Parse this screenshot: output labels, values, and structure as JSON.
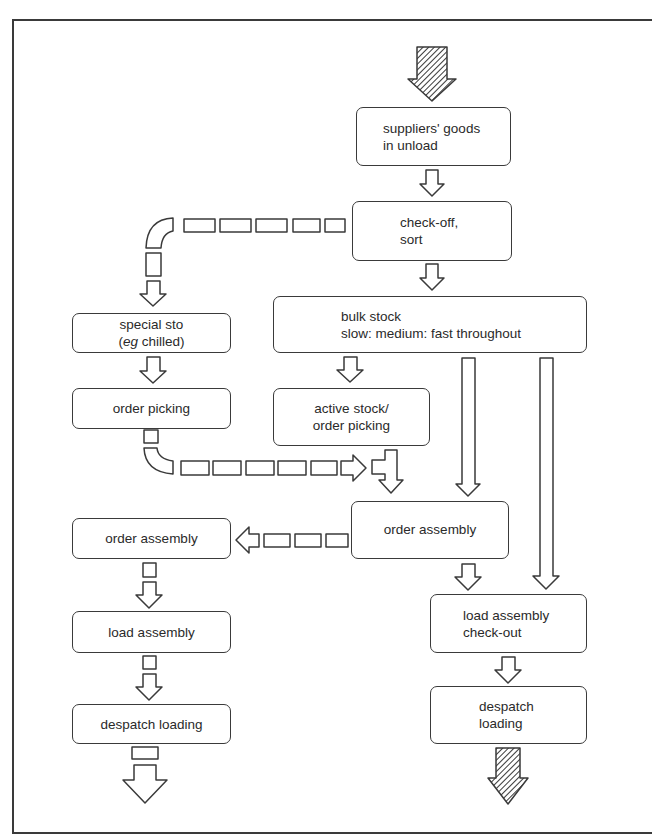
{
  "diagram": {
    "type": "warehouse flow diagram",
    "colors": {
      "line": "#3a3a3a",
      "background": "#ffffff",
      "hatch": "#3a3a3a"
    },
    "nodes": {
      "suppliers_goods": {
        "line1": "suppliers' goods",
        "line2": "in unload"
      },
      "check_off": {
        "line1": "check-off,",
        "line2": "sort"
      },
      "bulk_stock": {
        "line1": "bulk stock",
        "line2": "slow: medium: fast throughout"
      },
      "special_sto": {
        "line1": "special sto",
        "line2_open": "(",
        "line2_italic": "eg",
        "line2_rest": " chilled)"
      },
      "order_picking_left": {
        "label": "order picking"
      },
      "active_stock": {
        "line1": "active stock/",
        "line2": "order picking"
      },
      "order_assembly_right": {
        "label": "order assembly"
      },
      "order_assembly_left": {
        "label": "order assembly"
      },
      "load_assembly_checkout": {
        "line1": "load assembly",
        "line2": "check-out"
      },
      "load_assembly_left": {
        "label": "load assembly"
      },
      "despatch_loading_right": {
        "line1": "despatch",
        "line2": "loading"
      },
      "despatch_loading_left": {
        "label": "despatch loading"
      }
    },
    "arrows": [
      {
        "from": "entry",
        "to": "suppliers_goods",
        "style": "hatched"
      },
      {
        "from": "suppliers_goods",
        "to": "check_off",
        "style": "solid"
      },
      {
        "from": "check_off",
        "to": "special_sto",
        "style": "dashed"
      },
      {
        "from": "check_off",
        "to": "bulk_stock",
        "style": "solid"
      },
      {
        "from": "special_sto",
        "to": "order_picking_left",
        "style": "solid"
      },
      {
        "from": "bulk_stock",
        "to": "active_stock",
        "style": "solid"
      },
      {
        "from": "order_picking_left",
        "to": "order_assembly_right",
        "style": "dashed"
      },
      {
        "from": "active_stock",
        "to": "order_assembly_right",
        "style": "solid"
      },
      {
        "from": "bulk_stock",
        "to": "order_assembly_right",
        "style": "solid-long"
      },
      {
        "from": "bulk_stock",
        "to": "load_assembly_checkout",
        "style": "solid-long"
      },
      {
        "from": "order_assembly_right",
        "to": "order_assembly_left",
        "style": "dashed"
      },
      {
        "from": "order_assembly_right",
        "to": "load_assembly_checkout",
        "style": "solid"
      },
      {
        "from": "order_assembly_left",
        "to": "load_assembly_left",
        "style": "dashed"
      },
      {
        "from": "load_assembly_left",
        "to": "despatch_loading_left",
        "style": "dashed"
      },
      {
        "from": "load_assembly_checkout",
        "to": "despatch_loading_right",
        "style": "solid"
      },
      {
        "from": "despatch_loading_right",
        "to": "exit",
        "style": "hatched"
      },
      {
        "from": "despatch_loading_left",
        "to": "exit",
        "style": "dashed"
      }
    ]
  }
}
